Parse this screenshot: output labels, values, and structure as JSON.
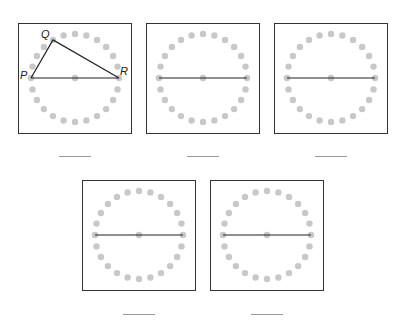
{
  "figure": {
    "dot_count": 24,
    "colors": {
      "dot": "#c8c8c8",
      "line": "#222222",
      "border": "#333333",
      "blank": "#9a9a9a"
    },
    "panels": [
      {
        "id": 1,
        "left": 18,
        "top": 23,
        "has_triangle": true,
        "labels": {
          "P": "P",
          "Q": "Q",
          "R": "R"
        },
        "q_angle_deg": 120
      },
      {
        "id": 2,
        "left": 146,
        "top": 23,
        "has_triangle": false
      },
      {
        "id": 3,
        "left": 274,
        "top": 23,
        "has_triangle": false
      },
      {
        "id": 4,
        "left": 82,
        "top": 180,
        "has_triangle": false
      },
      {
        "id": 5,
        "left": 210,
        "top": 180,
        "has_triangle": false
      }
    ],
    "answer_blanks": [
      {
        "left": 59,
        "top": 156,
        "value": ""
      },
      {
        "left": 187,
        "top": 156,
        "value": ""
      },
      {
        "left": 315,
        "top": 156,
        "value": ""
      },
      {
        "left": 123,
        "top": 314,
        "value": ""
      },
      {
        "left": 251,
        "top": 314,
        "value": ""
      }
    ]
  }
}
